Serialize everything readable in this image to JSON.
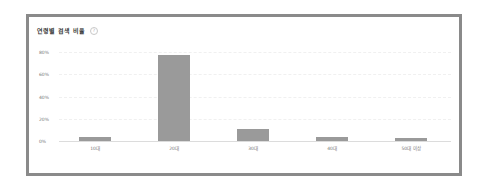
{
  "card": {
    "title": "연령별 검색 비율",
    "help_icon": "question-circle-icon",
    "help_glyph": "?"
  },
  "colors": {
    "bar": "#9a9a9a",
    "frame_border": "#8a8a8a",
    "axis_text": "#777777"
  },
  "axis": {
    "y_ticks": [
      "80%",
      "60%",
      "40%",
      "20%",
      "0%"
    ],
    "x_ticks": [
      "10대",
      "20대",
      "30대",
      "40대",
      "50대 이상"
    ]
  },
  "chart_data": {
    "type": "bar",
    "title": "연령별 검색 비율",
    "xlabel": "",
    "ylabel": "",
    "categories": [
      "10대",
      "20대",
      "30대",
      "40대",
      "50대 이상"
    ],
    "values": [
      3.5,
      77,
      10.5,
      3.5,
      3
    ],
    "unit": "%",
    "ylim": [
      0,
      80
    ],
    "y_ticks": [
      0,
      20,
      40,
      60,
      80
    ],
    "grid": true,
    "legend": null
  }
}
